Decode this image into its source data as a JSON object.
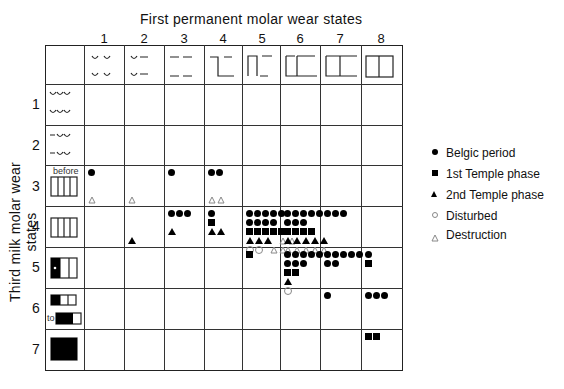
{
  "title": "First permanent molar wear states",
  "y_axis_label": "Third milk molar wear states",
  "columns": [
    "1",
    "2",
    "3",
    "4",
    "5",
    "6",
    "7",
    "8"
  ],
  "rows": [
    "1",
    "2",
    "3",
    "4",
    "5",
    "6",
    "7"
  ],
  "row_annotations": {
    "row3": "before",
    "row6": "to"
  },
  "legend": [
    {
      "symbol": "filled-circle",
      "label": "Belgic period"
    },
    {
      "symbol": "filled-square",
      "label": "1st Temple phase"
    },
    {
      "symbol": "filled-triangle",
      "label": "2nd Temple phase"
    },
    {
      "symbol": "open-circle",
      "label": "Disturbed"
    },
    {
      "symbol": "open-triangle",
      "label": "Destruction"
    }
  ],
  "cells": {
    "r3c1": [
      [
        "dot"
      ],
      [],
      [],
      [
        "otri"
      ]
    ],
    "r3c2": [
      [],
      [],
      [],
      [
        "otri"
      ]
    ],
    "r3c3": [
      [
        "dot"
      ]
    ],
    "r3c4": [
      [
        "dot",
        "dot"
      ],
      [],
      [],
      [
        "otri",
        "otri"
      ]
    ],
    "r4c2": [
      [],
      [],
      [],
      [
        "tri"
      ]
    ],
    "r4c3": [
      [
        "dot",
        "dot",
        "dot"
      ],
      [],
      [
        "tri"
      ]
    ],
    "r4c4": [
      [
        "dot"
      ],
      [
        "sq"
      ],
      [
        "tri",
        "tri"
      ]
    ],
    "r4c5": [
      [
        "dot",
        "dot",
        "dot",
        "dot",
        "dot"
      ],
      [
        "dot",
        "dot",
        "dot",
        "dot"
      ],
      [
        "sq",
        "sq",
        "sq",
        "sq",
        "sq"
      ],
      [
        "tri",
        "tri",
        "tri",
        "gap",
        "otri",
        "otri"
      ],
      [
        "ocirc",
        "ocirc",
        "gap",
        "otri",
        "otri"
      ]
    ],
    "r4c6": [
      [
        "dot",
        "dot",
        "dot",
        "dot",
        "dot"
      ],
      [
        "dot",
        "dot",
        "dot"
      ],
      [
        "sq",
        "sq",
        "sq",
        "sq"
      ],
      [
        "tri",
        "tri",
        "tri",
        "tri",
        "tri"
      ],
      [
        "otri",
        "otri",
        "otri",
        "otri",
        "otri"
      ]
    ],
    "r4c7": [
      [
        "dot",
        "dot",
        "dot"
      ]
    ],
    "r5c5": [
      [
        "sq"
      ]
    ],
    "r5c6": [
      [
        "dot",
        "dot",
        "dot",
        "dot",
        "dot"
      ],
      [
        "dot",
        "dot",
        "dot"
      ],
      [
        "sq",
        "sq"
      ],
      [
        "tri"
      ],
      [
        "ocirc"
      ]
    ],
    "r5c7": [
      [
        "dot",
        "dot",
        "dot",
        "dot",
        "dot"
      ],
      [
        "dot",
        "dot"
      ]
    ],
    "r5c8": [
      [
        "dot"
      ],
      [
        "sq"
      ]
    ],
    "r6c7": [
      [
        "dot"
      ]
    ],
    "r6c8": [
      [
        "dot",
        "dot",
        "dot"
      ]
    ],
    "r7c8": [
      [
        "sq",
        "sq"
      ]
    ]
  }
}
